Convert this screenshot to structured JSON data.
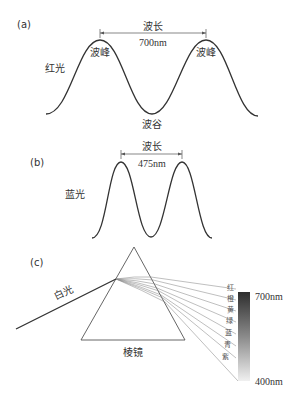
{
  "panels": {
    "a": {
      "label": "(a)",
      "light_name": "红光",
      "wavelength_label": "波长",
      "wavelength_value": "700nm",
      "peak_label_1": "波峰",
      "peak_label_2": "波峰",
      "trough_label": "波谷"
    },
    "b": {
      "label": "(b)",
      "light_name": "蓝光",
      "wavelength_label": "波长",
      "wavelength_value": "475nm"
    },
    "c": {
      "label": "(c)",
      "white_light_label": "白光",
      "prism_label": "棱镜",
      "spectrum_colors": [
        "红",
        "橙",
        "黄",
        "绿",
        "蓝",
        "青",
        "紫"
      ],
      "spectrum_top_label": "700nm",
      "spectrum_bottom_label": "400nm"
    }
  },
  "colors": {
    "line": "#333333",
    "ray": "#888888",
    "gradient_top": "#2e2e2e",
    "gradient_bottom": "#f0f0f0"
  }
}
